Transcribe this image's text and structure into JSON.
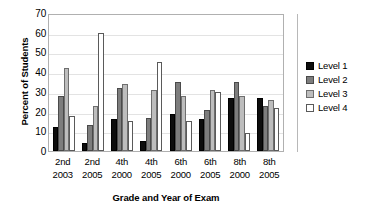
{
  "chart_data": {
    "type": "bar",
    "title": "",
    "subtitle": "",
    "xlabel": "Grade and Year of Exam",
    "ylabel": "Percent of Students",
    "ylim": [
      0,
      70
    ],
    "yticks": [
      0,
      10,
      20,
      30,
      40,
      50,
      60,
      70
    ],
    "ytick_labels": [
      "0",
      "10",
      "20",
      "30",
      "40",
      "50",
      "60",
      "70"
    ],
    "grid": true,
    "legend_position": "right",
    "categories": [
      "2nd 2003",
      "2nd 2005",
      "4th 2000",
      "4th 2005",
      "6th 2000",
      "6th 2005",
      "8th 2000",
      "8th 2005"
    ],
    "category_lines": [
      {
        "grade": "2nd",
        "year": "2003"
      },
      {
        "grade": "2nd",
        "year": "2005"
      },
      {
        "grade": "4th",
        "year": "2000"
      },
      {
        "grade": "4th",
        "year": "2005"
      },
      {
        "grade": "6th",
        "year": "2000"
      },
      {
        "grade": "6th",
        "year": "2005"
      },
      {
        "grade": "8th",
        "year": "2000"
      },
      {
        "grade": "8th",
        "year": "2005"
      }
    ],
    "series": [
      {
        "name": "Level 1",
        "color": "#0d0d0d",
        "values": [
          12,
          4,
          16,
          5,
          19,
          16,
          27,
          27
        ]
      },
      {
        "name": "Level 2",
        "color": "#7d7d7d",
        "values": [
          28,
          13,
          32,
          17,
          35,
          21,
          35,
          23
        ]
      },
      {
        "name": "Level 3",
        "color": "#bdbdbd",
        "values": [
          42,
          23,
          34,
          31,
          28,
          31,
          28,
          26
        ]
      },
      {
        "name": "Level 4",
        "color": "#ffffff",
        "values": [
          18,
          60,
          15,
          45,
          15,
          30,
          9,
          22
        ]
      }
    ]
  },
  "legend": {
    "items": [
      {
        "label": "Level 1"
      },
      {
        "label": "Level 2"
      },
      {
        "label": "Level 3"
      },
      {
        "label": "Level 4"
      }
    ]
  }
}
